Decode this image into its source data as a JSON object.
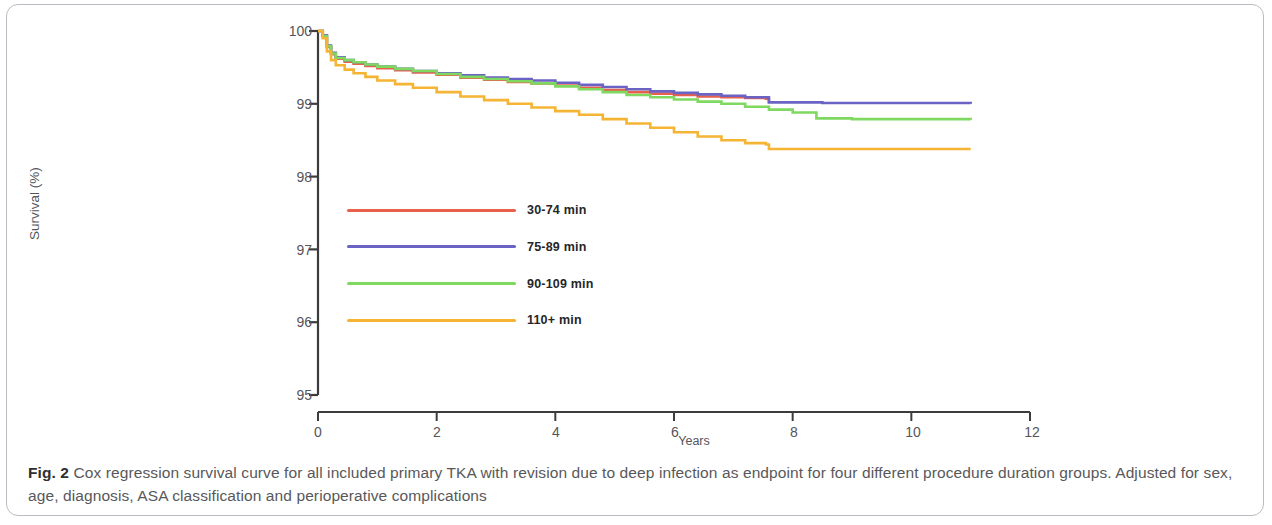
{
  "caption": {
    "label": "Fig. 2",
    "text": " Cox regression survival curve for all included primary TKA with revision due to deep infection as endpoint for four different procedure duration groups. Adjusted for sex, age, diagnosis, ASA classification and perioperative complications"
  },
  "chart_data": {
    "type": "line",
    "title": "",
    "subtitle": "",
    "xlabel": "Years",
    "ylabel": "Survival (%)",
    "xlim": [
      0,
      12
    ],
    "ylim": [
      95,
      100
    ],
    "xticks": [
      0,
      2,
      4,
      6,
      8,
      10,
      12
    ],
    "yticks": [
      95,
      96,
      97,
      98,
      99,
      100
    ],
    "grid": false,
    "legend_position": "inside-left",
    "legend": [
      "30-74 min",
      "75-89 min",
      "90-109 min",
      "110+ min"
    ],
    "colors": {
      "30-74 min": "#E8604C",
      "75-89 min": "#6B63C4",
      "90-109 min": "#7FD860",
      "110+ min": "#F5B433",
      "axis": "#3c3c3e",
      "tick_text": "#55555a",
      "caption_text": "#58585a",
      "frame": "#b9bcc0"
    },
    "series": [
      {
        "name": "30-74 min",
        "color": "#E8604C",
        "points": [
          [
            0.0,
            100.0
          ],
          [
            0.08,
            99.93
          ],
          [
            0.15,
            99.78
          ],
          [
            0.22,
            99.68
          ],
          [
            0.3,
            99.62
          ],
          [
            0.45,
            99.58
          ],
          [
            0.6,
            99.55
          ],
          [
            0.8,
            99.52
          ],
          [
            1.0,
            99.49
          ],
          [
            1.3,
            99.46
          ],
          [
            1.6,
            99.43
          ],
          [
            2.0,
            99.4
          ],
          [
            2.4,
            99.36
          ],
          [
            2.8,
            99.33
          ],
          [
            3.2,
            99.3
          ],
          [
            3.6,
            99.28
          ],
          [
            4.0,
            99.25
          ],
          [
            4.4,
            99.22
          ],
          [
            4.8,
            99.19
          ],
          [
            5.2,
            99.16
          ],
          [
            5.6,
            99.14
          ],
          [
            6.0,
            99.12
          ],
          [
            6.4,
            99.1
          ],
          [
            6.8,
            99.09
          ],
          [
            7.2,
            99.08
          ],
          [
            7.55,
            99.07
          ],
          [
            7.6,
            99.01
          ]
        ],
        "end_year": 7.6,
        "end_value": 99.01
      },
      {
        "name": "75-89 min",
        "color": "#6B63C4",
        "points": [
          [
            0.0,
            100.0
          ],
          [
            0.08,
            99.94
          ],
          [
            0.15,
            99.8
          ],
          [
            0.22,
            99.7
          ],
          [
            0.3,
            99.64
          ],
          [
            0.45,
            99.6
          ],
          [
            0.6,
            99.57
          ],
          [
            0.8,
            99.54
          ],
          [
            1.0,
            99.51
          ],
          [
            1.3,
            99.48
          ],
          [
            1.6,
            99.45
          ],
          [
            2.0,
            99.42
          ],
          [
            2.4,
            99.39
          ],
          [
            2.8,
            99.36
          ],
          [
            3.2,
            99.34
          ],
          [
            3.6,
            99.32
          ],
          [
            4.0,
            99.29
          ],
          [
            4.4,
            99.26
          ],
          [
            4.8,
            99.23
          ],
          [
            5.2,
            99.2
          ],
          [
            5.6,
            99.17
          ],
          [
            6.0,
            99.15
          ],
          [
            6.4,
            99.13
          ],
          [
            6.8,
            99.11
          ],
          [
            7.2,
            99.09
          ],
          [
            7.6,
            99.02
          ],
          [
            8.5,
            99.01
          ],
          [
            9.5,
            99.01
          ],
          [
            11.0,
            99.0
          ]
        ],
        "end_year": 11.0,
        "end_value": 99.0
      },
      {
        "name": "90-109 min",
        "color": "#7FD860",
        "points": [
          [
            0.0,
            100.0
          ],
          [
            0.08,
            99.93
          ],
          [
            0.15,
            99.79
          ],
          [
            0.22,
            99.69
          ],
          [
            0.3,
            99.63
          ],
          [
            0.45,
            99.6
          ],
          [
            0.6,
            99.57
          ],
          [
            0.8,
            99.54
          ],
          [
            1.0,
            99.51
          ],
          [
            1.3,
            99.48
          ],
          [
            1.6,
            99.45
          ],
          [
            2.0,
            99.41
          ],
          [
            2.4,
            99.37
          ],
          [
            2.8,
            99.34
          ],
          [
            3.2,
            99.31
          ],
          [
            3.6,
            99.28
          ],
          [
            4.0,
            99.24
          ],
          [
            4.4,
            99.2
          ],
          [
            4.8,
            99.16
          ],
          [
            5.2,
            99.12
          ],
          [
            5.6,
            99.09
          ],
          [
            6.0,
            99.06
          ],
          [
            6.4,
            99.03
          ],
          [
            6.8,
            99.0
          ],
          [
            7.2,
            98.96
          ],
          [
            7.6,
            98.92
          ],
          [
            8.0,
            98.88
          ],
          [
            8.4,
            98.8
          ],
          [
            9.0,
            98.79
          ],
          [
            10.0,
            98.79
          ],
          [
            11.0,
            98.78
          ]
        ],
        "end_year": 11.0,
        "end_value": 98.78
      },
      {
        "name": "110+ min",
        "color": "#F5B433",
        "points": [
          [
            0.0,
            100.0
          ],
          [
            0.08,
            99.9
          ],
          [
            0.15,
            99.72
          ],
          [
            0.22,
            99.6
          ],
          [
            0.3,
            99.53
          ],
          [
            0.45,
            99.47
          ],
          [
            0.6,
            99.42
          ],
          [
            0.8,
            99.37
          ],
          [
            1.0,
            99.32
          ],
          [
            1.3,
            99.27
          ],
          [
            1.6,
            99.22
          ],
          [
            2.0,
            99.16
          ],
          [
            2.4,
            99.1
          ],
          [
            2.8,
            99.05
          ],
          [
            3.2,
            99.0
          ],
          [
            3.6,
            98.95
          ],
          [
            4.0,
            98.9
          ],
          [
            4.4,
            98.85
          ],
          [
            4.8,
            98.79
          ],
          [
            5.2,
            98.73
          ],
          [
            5.6,
            98.67
          ],
          [
            6.0,
            98.61
          ],
          [
            6.4,
            98.55
          ],
          [
            6.8,
            98.5
          ],
          [
            7.2,
            98.46
          ],
          [
            7.55,
            98.44
          ],
          [
            7.6,
            98.38
          ],
          [
            8.5,
            98.38
          ],
          [
            9.5,
            98.38
          ],
          [
            11.0,
            98.38
          ]
        ],
        "end_year": 11.0,
        "end_value": 98.38
      }
    ]
  }
}
